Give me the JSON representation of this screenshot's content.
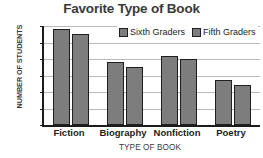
{
  "chart_data": {
    "type": "bar",
    "title": "Favorite Type of Book",
    "xlabel": "TYPE OF BOOK",
    "ylabel": "NUMBER OF STUDENTS",
    "categories": [
      "Fiction",
      "Biography",
      "Nonfiction",
      "Poetry"
    ],
    "series": [
      {
        "name": "Sixth Graders",
        "values": [
          290,
          190,
          208,
          135
        ],
        "color": "#7d7d7d"
      },
      {
        "name": "Fifth Graders",
        "values": [
          275,
          175,
          200,
          122
        ],
        "color": "#7d7d7d"
      }
    ],
    "ylim": [
      0,
      300
    ],
    "yticks": [
      0,
      50,
      100,
      150,
      200,
      250,
      300
    ],
    "ytick_labels": [
      "0",
      "50",
      "100",
      "150",
      "200",
      "250",
      "300"
    ],
    "grid": true,
    "legend_position": "top-right-inside",
    "bar_border_color": "#1f1f1f",
    "axis_color": "#1c1c1c",
    "gridline_color": "#b9b9b9",
    "title_color": "#3a3a3a",
    "background": "#ffffff"
  }
}
